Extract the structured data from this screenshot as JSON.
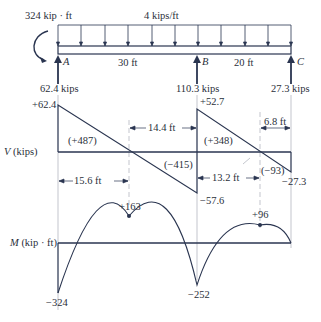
{
  "beam": {
    "applied_moment": "324 kip · ft",
    "distributed_load": "4 kips/ft",
    "supports": [
      {
        "name": "A",
        "reaction": "62.4 kips"
      },
      {
        "name": "B",
        "reaction": "110.3 kips"
      },
      {
        "name": "C",
        "reaction": "27.3 kips"
      }
    ],
    "spans": [
      "30 ft",
      "20 ft"
    ]
  },
  "shear_diagram": {
    "axis_label_var": "V",
    "axis_label_unit": "(kips)",
    "values": [
      "+62.4",
      "−57.6",
      "+52.7",
      "−27.3"
    ],
    "areas": [
      "(+487)",
      "(−415)",
      "(+348)",
      "(−93)"
    ],
    "dimensions": [
      "15.6 ft",
      "14.4 ft",
      "13.2 ft",
      "6.8 ft"
    ]
  },
  "moment_diagram": {
    "axis_label_var": "M",
    "axis_label_unit": "(kip · ft)",
    "values": [
      "−324",
      "+163",
      "−252",
      "+96"
    ]
  },
  "colors": {
    "line": "#2a3550",
    "light_line": "#9aa0ab",
    "text": "#2a2f3a"
  }
}
